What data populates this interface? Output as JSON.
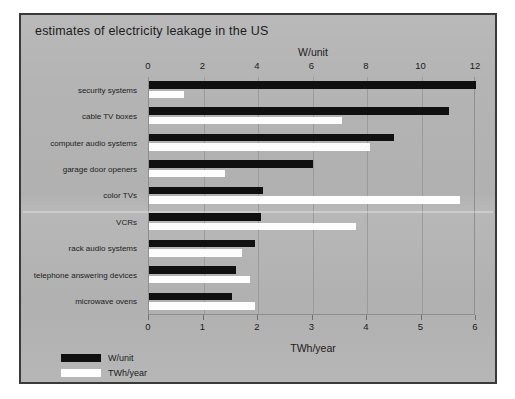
{
  "title": "estimates of electricity leakage in the US",
  "chart_data": {
    "type": "bar",
    "orientation": "horizontal",
    "title": "estimates of electricity leakage in the US",
    "categories": [
      "security systems",
      "cable TV boxes",
      "computer audio systems",
      "garage door openers",
      "color TVs",
      "VCRs",
      "rack audio systems",
      "telephone answering devices",
      "microwave ovens"
    ],
    "series": [
      {
        "name": "W/unit",
        "color": "#101010",
        "axis": "top",
        "values": [
          12.0,
          11.0,
          9.0,
          6.0,
          4.2,
          4.1,
          3.9,
          3.2,
          3.05
        ]
      },
      {
        "name": "TWh/year",
        "color": "#fdfdfd",
        "axis": "bottom",
        "values": [
          0.65,
          3.55,
          4.05,
          1.4,
          5.7,
          3.8,
          1.7,
          1.85,
          1.95
        ]
      }
    ],
    "top_axis": {
      "label": "W/unit",
      "ticks": [
        0,
        2,
        4,
        6,
        8,
        10,
        12
      ],
      "range": [
        0,
        12
      ]
    },
    "bottom_axis": {
      "label": "TWh/year",
      "ticks": [
        0,
        1,
        2,
        3,
        4,
        5,
        6
      ],
      "range": [
        0,
        6
      ]
    },
    "grid": true,
    "legend_position": "bottom-left",
    "xlabel": "",
    "ylabel": ""
  },
  "legend": [
    {
      "label": "W/unit",
      "color": "#101010"
    },
    {
      "label": "TWh/year",
      "color": "#fdfdfd"
    }
  ],
  "colors": {
    "card_background": "#b4b4b4",
    "card_border": "#3a3a3a",
    "bar_w_unit": "#101010",
    "bar_twh": "#fdfdfd",
    "gridline": "#9b9b9b",
    "text": "#1b1b1b"
  }
}
